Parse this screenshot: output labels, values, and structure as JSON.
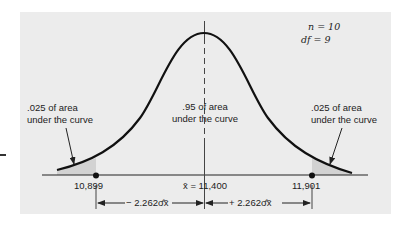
{
  "figure": {
    "params": {
      "n_label": "n = 10",
      "df_label": "df = 9"
    },
    "regions": {
      "left_tail": {
        "line1": ".025 of area",
        "line2": "under the curve"
      },
      "center": {
        "line1": ".95 of area",
        "line2": "under the curve"
      },
      "right_tail": {
        "line1": ".025 of area",
        "line2": "under the curve"
      }
    },
    "axis": {
      "lower_bound": "10,899",
      "mean": "x̄ = 11,400",
      "upper_bound": "11,901"
    },
    "intervals": {
      "left": "− 2.262σ̂x̄",
      "right": "+ 2.262σ̂x̄"
    },
    "colors": {
      "panel_bg": "#ececec",
      "shaded_tail": "#d2d2d2",
      "curve": "#111111"
    }
  }
}
